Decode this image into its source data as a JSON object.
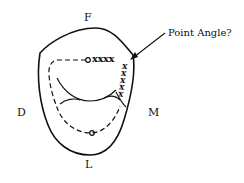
{
  "diagram": {
    "type": "tooth-cavity-outline",
    "labels": {
      "top": "F",
      "left": "D",
      "right": "M",
      "bottom": "L"
    },
    "annotation": {
      "text": "Point Angle?"
    },
    "marks": {
      "top_row": "xxxx",
      "right_column": "xxxxx"
    },
    "colors": {
      "stroke": "#111111",
      "background": "#ffffff"
    }
  }
}
